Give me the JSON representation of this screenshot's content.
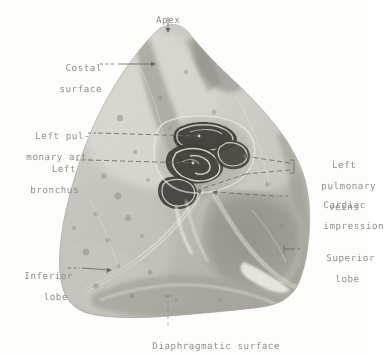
{
  "figure": {
    "background_color": "#fdfdfc",
    "label_color": "#8d8a86",
    "leader_color": "#6f6c68"
  },
  "labels": {
    "apex": "Apex",
    "costal_surface_l1": "Costal",
    "costal_surface_l2": "surface",
    "left_pulmonary_artery_l1": "Left pul-",
    "left_pulmonary_artery_l2": "monary art.",
    "left_bronchus_l1": "Left",
    "left_bronchus_l2": "bronchus",
    "left_pulmonary_veins_l1": "Left",
    "left_pulmonary_veins_l2": "pulmonary",
    "left_pulmonary_veins_l3": "veins",
    "cardiac_impression_l1": "Cardiac",
    "cardiac_impression_l2": "impression",
    "superior_lobe_l1": "Superior",
    "superior_lobe_l2": "lobe",
    "inferior_lobe_l1": "Inferior",
    "inferior_lobe_l2": "lobe",
    "diaphragmatic_surface": "Diaphragmatic surface"
  },
  "specimen": {
    "name": "left-lung-specimen",
    "structures": [
      "apex",
      "costal surface",
      "left pulmonary artery",
      "left bronchus",
      "left pulmonary veins",
      "cardiac impression",
      "superior lobe",
      "inferior lobe",
      "oblique fissure",
      "diaphragmatic surface"
    ]
  }
}
